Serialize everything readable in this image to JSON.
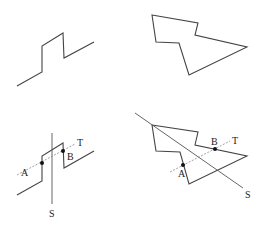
{
  "figure": {
    "panels": [
      {
        "id": "top-left",
        "shape": "open polyline (zigzag step)",
        "points": [
          [
            17,
            86
          ],
          [
            42,
            72
          ],
          [
            42,
            46
          ],
          [
            63,
            33
          ],
          [
            64,
            58
          ],
          [
            94,
            42
          ]
        ]
      },
      {
        "id": "top-right",
        "shape": "closed polygon",
        "points": [
          [
            152,
            15
          ],
          [
            198,
            23
          ],
          [
            195,
            35
          ],
          [
            247,
            47
          ],
          [
            189,
            75
          ],
          [
            179,
            43
          ],
          [
            156,
            42
          ]
        ]
      },
      {
        "id": "bottom-left",
        "shape": "open polyline with lines S and T",
        "points": [
          [
            17,
            195
          ],
          [
            42,
            181
          ],
          [
            42,
            156
          ],
          [
            63,
            143
          ],
          [
            64,
            168
          ],
          [
            94,
            151
          ]
        ],
        "labels": {
          "A": "A",
          "B": "B",
          "S": "S",
          "T": "T"
        }
      },
      {
        "id": "bottom-right",
        "shape": "closed polygon with lines S and T",
        "points": [
          [
            152,
            125
          ],
          [
            198,
            132
          ],
          [
            195,
            145
          ],
          [
            247,
            156
          ],
          [
            189,
            184
          ],
          [
            180,
            152
          ],
          [
            156,
            151
          ]
        ],
        "labels": {
          "A": "A",
          "B": "B",
          "S": "S",
          "T": "T"
        }
      }
    ]
  }
}
